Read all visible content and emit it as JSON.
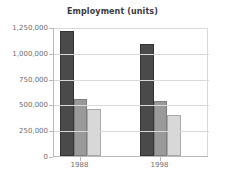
{
  "chart_data": {
    "type": "bar",
    "title": "Employment (units)",
    "xlabel": "",
    "ylabel": "",
    "categories": [
      "1988",
      "1998"
    ],
    "series": [
      {
        "name": "series-1",
        "color": "#4a4a4a",
        "values": [
          1210000,
          1085000
        ]
      },
      {
        "name": "series-2",
        "color": "#9a9a9a",
        "values": [
          550000,
          535000
        ]
      },
      {
        "name": "series-3",
        "color": "#d8d8d8",
        "values": [
          460000,
          400000
        ]
      }
    ],
    "ylim": [
      0,
      1250000
    ],
    "yticks": [
      0,
      250000,
      500000,
      750000,
      1000000,
      1250000
    ],
    "ytick_labels": [
      "0",
      "250,000",
      "500,000",
      "750,000",
      "1,000,000",
      "1,250,000"
    ],
    "grid": true,
    "legend": "none"
  }
}
